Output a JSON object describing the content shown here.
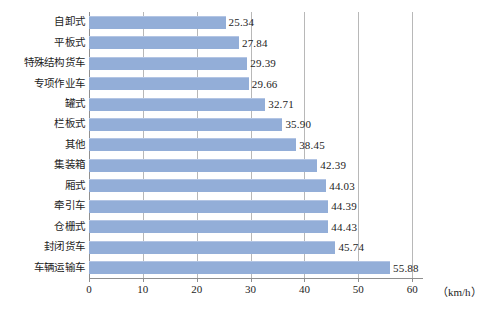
{
  "chart_data": {
    "type": "bar",
    "orientation": "horizontal",
    "title": "",
    "subtitle": "",
    "xlabel": "（km/h）",
    "ylabel": "",
    "unit": "km/h",
    "xlim": [
      0,
      62
    ],
    "xticks": [
      0,
      10,
      20,
      30,
      40,
      50,
      60
    ],
    "xtick_labels": [
      "0",
      "10",
      "20",
      "30",
      "40",
      "50",
      "60"
    ],
    "grid": "vertical",
    "legend": "none",
    "bar_color": "#93aed8",
    "gridline_color": "#b8b8b8",
    "axis_color": "#8f8f8f",
    "categories": [
      "自卸式",
      "平板式",
      "特殊结构货车",
      "专项作业车",
      "罐式",
      "栏板式",
      "其他",
      "集装箱",
      "厢式",
      "牵引车",
      "仓栅式",
      "封闭货车",
      "车辆运输车"
    ],
    "values": [
      25.34,
      27.84,
      29.39,
      29.66,
      32.71,
      35.9,
      38.45,
      42.39,
      44.03,
      44.39,
      44.43,
      45.74,
      55.88
    ],
    "value_labels": [
      "25.34",
      "27.84",
      "29.39",
      "29.66",
      "32.71",
      "35.90",
      "38.45",
      "42.39",
      "44.03",
      "44.39",
      "44.43",
      "45.74",
      "55.88"
    ]
  }
}
